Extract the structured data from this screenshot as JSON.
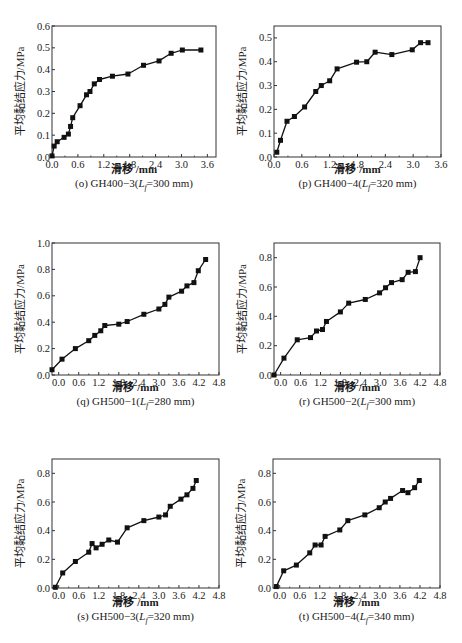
{
  "chart_data": [
    {
      "id": "o",
      "type": "line",
      "caption": {
        "prefix": "(o) GH400−3(",
        "var": "L",
        "sub": "f",
        "suffix": "=300 mm)"
      },
      "xlabel": "滑移 /mm",
      "ylabel": "平均黏结应力/MPa",
      "xlim": [
        0,
        3.8
      ],
      "ylim": [
        0,
        0.6
      ],
      "xticks": [
        0.0,
        0.6,
        1.2,
        1.8,
        2.4,
        3.0,
        3.6
      ],
      "xtick_labels": [
        "0.0",
        "0.6",
        "1.2",
        "1.8",
        "2.4",
        "3.0",
        "3.6"
      ],
      "yticks": [
        0.0,
        0.1,
        0.2,
        0.3,
        0.4,
        0.5,
        0.6
      ],
      "ytick_labels": [
        "0.0",
        "0.1",
        "0.2",
        "0.3",
        "0.4",
        "0.5",
        "0.6"
      ],
      "marker": "square",
      "x": [
        0.0,
        0.05,
        0.12,
        0.28,
        0.38,
        0.43,
        0.48,
        0.65,
        0.8,
        0.88,
        0.98,
        1.1,
        1.4,
        1.76,
        2.12,
        2.48,
        2.76,
        3.02,
        3.45
      ],
      "y": [
        0.005,
        0.05,
        0.07,
        0.09,
        0.105,
        0.14,
        0.18,
        0.235,
        0.285,
        0.3,
        0.335,
        0.355,
        0.37,
        0.38,
        0.42,
        0.44,
        0.475,
        0.49,
        0.49
      ]
    },
    {
      "id": "p",
      "type": "line",
      "caption": {
        "prefix": "(p) GH400−4(",
        "var": "L",
        "sub": "f",
        "suffix": "=320 mm)"
      },
      "xlabel": "滑移 /mm",
      "ylabel": "平均黏结应力/MPa",
      "xlim": [
        0,
        3.6
      ],
      "ylim": [
        0,
        0.55
      ],
      "xticks": [
        0.0,
        0.6,
        1.2,
        1.8,
        2.4,
        3.0,
        3.6
      ],
      "xtick_labels": [
        "0.0",
        "0.6",
        "1.2",
        "1.8",
        "2.4",
        "3.0",
        "3.6"
      ],
      "yticks": [
        0.0,
        0.1,
        0.2,
        0.3,
        0.4,
        0.5
      ],
      "ytick_labels": [
        "0.0",
        "0.1",
        "0.2",
        "0.3",
        "0.4",
        "0.5"
      ],
      "marker": "square",
      "x": [
        0.06,
        0.14,
        0.28,
        0.44,
        0.66,
        0.9,
        1.02,
        1.2,
        1.36,
        1.78,
        2.0,
        2.18,
        2.54,
        2.98,
        3.16,
        3.32
      ],
      "y": [
        0.02,
        0.07,
        0.15,
        0.17,
        0.21,
        0.275,
        0.3,
        0.32,
        0.37,
        0.398,
        0.4,
        0.44,
        0.43,
        0.45,
        0.48,
        0.48
      ]
    },
    {
      "id": "q",
      "type": "line",
      "caption": {
        "prefix": "(q) GH500−1(",
        "var": "L",
        "sub": "f",
        "suffix": "=280 mm)"
      },
      "xlabel": "滑移 /mm",
      "ylabel": "平均黏结应力/MPa",
      "xlim": [
        -0.2,
        4.8
      ],
      "ylim": [
        0,
        1.0
      ],
      "xticks": [
        0.0,
        0.6,
        1.2,
        1.8,
        2.4,
        3.0,
        3.6,
        4.2,
        4.8
      ],
      "xtick_labels": [
        "0.0",
        "0.6",
        "1.2",
        "1.8",
        "2.4",
        "3.0",
        "3.6",
        "4.2",
        "4.8"
      ],
      "yticks": [
        0.0,
        0.2,
        0.4,
        0.6,
        0.8,
        1.0
      ],
      "ytick_labels": [
        "0.0",
        "0.2",
        "0.4",
        "0.6",
        "0.8",
        "1.0"
      ],
      "marker": "square",
      "x": [
        -0.2,
        0.1,
        0.5,
        0.9,
        1.08,
        1.26,
        1.38,
        1.8,
        2.05,
        2.55,
        3.0,
        3.18,
        3.3,
        3.68,
        3.84,
        4.05,
        4.18,
        4.4
      ],
      "y": [
        0.04,
        0.12,
        0.2,
        0.26,
        0.3,
        0.335,
        0.375,
        0.385,
        0.405,
        0.46,
        0.5,
        0.535,
        0.59,
        0.635,
        0.675,
        0.7,
        0.79,
        0.875
      ]
    },
    {
      "id": "r",
      "type": "line",
      "caption": {
        "prefix": "(r) GH500−2(",
        "var": "L",
        "sub": "f",
        "suffix": "=300 mm)"
      },
      "xlabel": "滑移 /mm",
      "ylabel": "平均黏结应力/MPa",
      "xlim": [
        -0.2,
        4.8
      ],
      "ylim": [
        0,
        0.9
      ],
      "xticks": [
        0.0,
        0.6,
        1.2,
        1.8,
        2.4,
        3.0,
        3.6,
        4.2,
        4.8
      ],
      "xtick_labels": [
        "0.0",
        "0.6",
        "1.2",
        "1.8",
        "2.4",
        "3.0",
        "3.6",
        "4.2",
        "4.8"
      ],
      "yticks": [
        0.0,
        0.2,
        0.4,
        0.6,
        0.8
      ],
      "ytick_labels": [
        "0.0",
        "0.2",
        "0.4",
        "0.6",
        "0.8"
      ],
      "marker": "square",
      "x": [
        -0.2,
        0.1,
        0.5,
        0.9,
        1.08,
        1.26,
        1.38,
        1.8,
        2.05,
        2.55,
        2.98,
        3.16,
        3.34,
        3.66,
        3.84,
        4.06,
        4.2
      ],
      "y": [
        0.0,
        0.115,
        0.24,
        0.255,
        0.3,
        0.31,
        0.365,
        0.43,
        0.49,
        0.515,
        0.56,
        0.595,
        0.63,
        0.65,
        0.7,
        0.705,
        0.8
      ]
    },
    {
      "id": "s",
      "type": "line",
      "caption": {
        "prefix": "(s) GH500−3(",
        "var": "L",
        "sub": "f",
        "suffix": "=320 mm)"
      },
      "xlabel": "滑移 /mm",
      "ylabel": "平均黏结应力/MPa",
      "xlim": [
        -0.2,
        4.8
      ],
      "ylim": [
        0,
        0.9
      ],
      "xticks": [
        0.0,
        0.6,
        1.2,
        1.8,
        2.4,
        3.0,
        3.6,
        4.2,
        4.8
      ],
      "xtick_labels": [
        "0.0",
        "0.6",
        "1.2",
        "1.8",
        "2.4",
        "3.0",
        "3.6",
        "4.2",
        "4.8"
      ],
      "yticks": [
        0.0,
        0.2,
        0.4,
        0.6,
        0.8
      ],
      "ytick_labels": [
        "0.0",
        "0.2",
        "0.4",
        "0.6",
        "0.8"
      ],
      "marker": "square",
      "x": [
        -0.1,
        0.12,
        0.5,
        0.9,
        1.0,
        1.12,
        1.3,
        1.5,
        1.76,
        2.05,
        2.55,
        3.0,
        3.2,
        3.34,
        3.66,
        3.84,
        4.02,
        4.12
      ],
      "y": [
        0.005,
        0.105,
        0.185,
        0.25,
        0.31,
        0.28,
        0.305,
        0.335,
        0.32,
        0.42,
        0.47,
        0.495,
        0.51,
        0.57,
        0.62,
        0.65,
        0.695,
        0.75
      ]
    },
    {
      "id": "t",
      "type": "line",
      "caption": {
        "prefix": "(t) GH500−4(",
        "var": "L",
        "sub": "f",
        "suffix": "=340 mm)"
      },
      "xlabel": "滑移 /mm",
      "ylabel": "平均黏结应力/MPa",
      "xlim": [
        -0.2,
        4.8
      ],
      "ylim": [
        0,
        0.9
      ],
      "xticks": [
        0.0,
        0.6,
        1.2,
        1.8,
        2.4,
        3.0,
        3.6,
        4.2,
        4.8
      ],
      "xtick_labels": [
        "0.0",
        "0.6",
        "1.2",
        "1.8",
        "2.4",
        "3.0",
        "3.6",
        "4.2",
        "4.8"
      ],
      "yticks": [
        0.0,
        0.2,
        0.4,
        0.6,
        0.8
      ],
      "ytick_labels": [
        "0.0",
        "0.2",
        "0.4",
        "0.6",
        "0.8"
      ],
      "marker": "square",
      "x": [
        -0.1,
        0.12,
        0.5,
        0.9,
        1.06,
        1.24,
        1.36,
        1.8,
        2.04,
        2.55,
        2.98,
        3.16,
        3.32,
        3.68,
        3.84,
        4.04,
        4.18
      ],
      "y": [
        0.01,
        0.12,
        0.16,
        0.245,
        0.3,
        0.3,
        0.36,
        0.405,
        0.47,
        0.51,
        0.56,
        0.6,
        0.625,
        0.68,
        0.665,
        0.7,
        0.75
      ]
    }
  ],
  "layout": {
    "panels": [
      {
        "id": "o",
        "left": 52,
        "top": 26,
        "width": 164,
        "height": 131,
        "cap_x": 110,
        "cap_y": 187,
        "xl_y": 167
      },
      {
        "id": "p",
        "left": 274,
        "top": 26,
        "width": 167,
        "height": 131,
        "cap_x": 340,
        "cap_y": 187,
        "xl_y": 167
      },
      {
        "id": "q",
        "left": 52,
        "top": 243,
        "width": 167,
        "height": 132,
        "cap_x": 128,
        "cap_y": 405,
        "xl_y": 385
      },
      {
        "id": "r",
        "left": 274,
        "top": 243,
        "width": 166,
        "height": 132,
        "cap_x": 350,
        "cap_y": 405,
        "xl_y": 385
      },
      {
        "id": "s",
        "left": 52,
        "top": 459,
        "width": 167,
        "height": 129,
        "cap_x": 128,
        "cap_y": 620,
        "xl_y": 600
      },
      {
        "id": "t",
        "left": 273,
        "top": 459,
        "width": 167,
        "height": 129,
        "cap_x": 350,
        "cap_y": 620,
        "xl_y": 600
      }
    ],
    "line_color": "#111111",
    "frame_color": "#333333"
  }
}
